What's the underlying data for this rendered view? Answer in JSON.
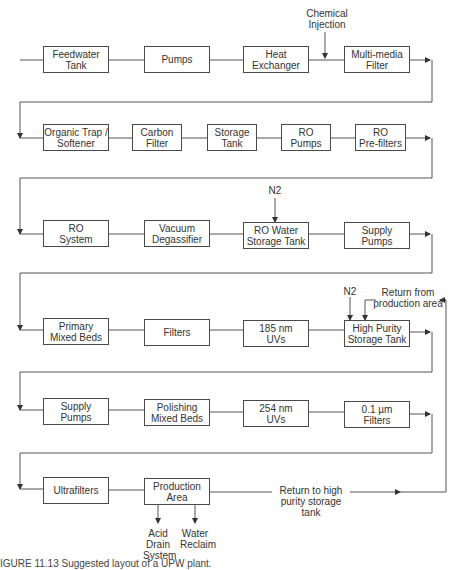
{
  "diagram": {
    "rows": [
      {
        "boxes": [
          "Feedwater\nTank",
          "Pumps",
          "Heat\nExchanger",
          "Multi-media\nFilter"
        ]
      },
      {
        "boxes": [
          "Organic Trap /\nSoftener",
          "Carbon\nFilter",
          "Storage\nTank",
          "RO\nPumps",
          "RO\nPre-filters"
        ]
      },
      {
        "boxes": [
          "RO\nSystem",
          "Vacuum\nDegassifier",
          "RO Water\nStorage Tank",
          "Supply\nPumps"
        ]
      },
      {
        "boxes": [
          "Primary\nMixed Beds",
          "Filters",
          "185 nm\nUVs",
          "High Purity\nStorage Tank"
        ]
      },
      {
        "boxes": [
          "Supply\nPumps",
          "Polishing\nMixed Beds",
          "254 nm\nUVs",
          "0.1 µm\nFilters"
        ]
      },
      {
        "boxes": [
          "Ultrafilters",
          "Production\nArea"
        ]
      }
    ],
    "annotations": {
      "chemical_injection": "Chemical\nInjection",
      "n2_ro": "N2",
      "n2_hp": "N2",
      "return_from_production": "Return from\nproduction area",
      "return_to_hp": "Return to high\npurity storage tank",
      "acid_drain": "Acid\nDrain\nSystem",
      "water_reclaim": "Water\nReclaim"
    },
    "caption": "IGURE 11.13  Suggested layout of a UPW plant."
  }
}
